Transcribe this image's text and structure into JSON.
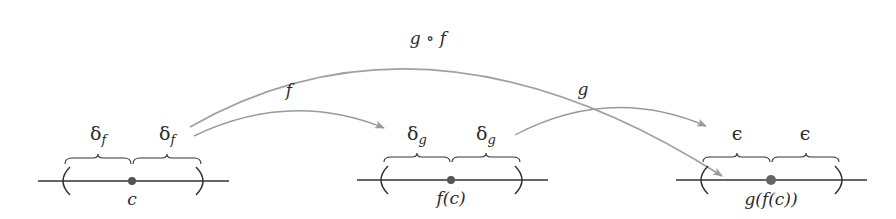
{
  "diagram": {
    "type": "function-composition-continuity",
    "arrows": [
      {
        "label": "g ∘ f",
        "from": "c",
        "to": "g(f(c))"
      },
      {
        "label": "f",
        "from": "c",
        "to": "f(c)"
      },
      {
        "label": "g",
        "from": "f(c)",
        "to": "g(f(c))"
      }
    ],
    "number_lines": [
      {
        "point_label": "c",
        "interval_labels": [
          "δ_f",
          "δ_f"
        ],
        "sym": "δ",
        "sub": "f"
      },
      {
        "point_label": "f(c)",
        "interval_labels": [
          "δ_g",
          "δ_g"
        ],
        "sym": "δ",
        "sub": "g"
      },
      {
        "point_label": "g(f(c))",
        "interval_labels": [
          "ϵ",
          "ϵ"
        ],
        "sym": "ϵ",
        "sub": ""
      }
    ],
    "colors": {
      "arrow": "#9a9a9a",
      "line": "#333333",
      "dot": "#555555",
      "text": "#2a2a2a"
    }
  },
  "labels": {
    "gof": "g ∘ f",
    "f": "f",
    "g": "g",
    "c": "c",
    "fc": "f(c)",
    "gfc": "g(f(c))",
    "delta": "δ",
    "sub_f": "f",
    "sub_g": "g",
    "eps": "ϵ"
  }
}
